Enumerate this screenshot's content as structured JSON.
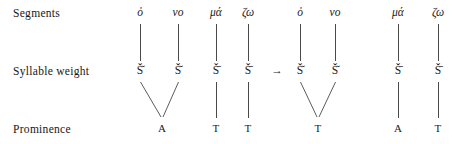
{
  "diagram": {
    "rows": [
      {
        "key": "segments",
        "label": "Segments"
      },
      {
        "key": "weight",
        "label": "Syllable weight"
      },
      {
        "key": "prominence",
        "label": "Prominence"
      }
    ],
    "operator": "→",
    "groups": [
      {
        "name": "input",
        "segments": [
          "ὀ",
          "νο",
          "μά",
          "ζω"
        ],
        "weight": [
          "Š̆",
          "Š̆",
          "Š̄",
          "Š̄"
        ],
        "prominence": [
          "A",
          "T",
          "T"
        ]
      },
      {
        "name": "output",
        "segments": [
          "ὀ",
          "νο",
          "μά",
          "ζω"
        ],
        "weight": [
          "Š̆",
          "Š̆",
          "Š̄",
          "Š̄"
        ],
        "prominence": [
          "T",
          "A",
          "T"
        ]
      }
    ]
  },
  "colors": {
    "text": "#1a1a1a",
    "line": "#4a4a4a",
    "background": "#ffffff"
  }
}
